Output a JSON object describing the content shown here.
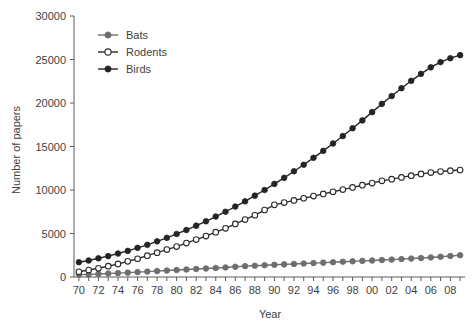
{
  "chart_data": {
    "type": "line",
    "title": "",
    "xlabel": "Year",
    "ylabel": "Number of papers",
    "xlim": [
      1969.5,
      2009.5
    ],
    "ylim": [
      0,
      30000
    ],
    "grid": false,
    "legend_position": "top-left-inside",
    "y_ticks": [
      0,
      5000,
      10000,
      15000,
      20000,
      25000,
      30000
    ],
    "y_tick_labels": [
      "0",
      "5000",
      "10000",
      "15000",
      "20000",
      "25000",
      "30000"
    ],
    "x_ticks": [
      1970,
      1971,
      1972,
      1973,
      1974,
      1975,
      1976,
      1977,
      1978,
      1979,
      1980,
      1981,
      1982,
      1983,
      1984,
      1985,
      1986,
      1987,
      1988,
      1989,
      1990,
      1991,
      1992,
      1993,
      1994,
      1995,
      1996,
      1997,
      1998,
      1999,
      2000,
      2001,
      2002,
      2003,
      2004,
      2005,
      2006,
      2007,
      2008,
      2009
    ],
    "x_tick_labels": [
      "70",
      "",
      "72",
      "",
      "74",
      "",
      "76",
      "",
      "78",
      "",
      "80",
      "",
      "82",
      "",
      "84",
      "",
      "86",
      "",
      "88",
      "",
      "90",
      "",
      "92",
      "",
      "94",
      "",
      "96",
      "",
      "98",
      "",
      "00",
      "",
      "02",
      "",
      "04",
      "",
      "06",
      "",
      "08",
      ""
    ],
    "x": [
      1970,
      1971,
      1972,
      1973,
      1974,
      1975,
      1976,
      1977,
      1978,
      1979,
      1980,
      1981,
      1982,
      1983,
      1984,
      1985,
      1986,
      1987,
      1988,
      1989,
      1990,
      1991,
      1992,
      1993,
      1994,
      1995,
      1996,
      1997,
      1998,
      1999,
      2000,
      2001,
      2002,
      2003,
      2004,
      2005,
      2006,
      2007,
      2008,
      2009
    ],
    "series": [
      {
        "name": "Bats",
        "marker": "filled-circle",
        "color": "#6e6e6e",
        "line_color": "#6e6e6e",
        "values": [
          250,
          300,
          350,
          400,
          450,
          500,
          560,
          620,
          680,
          740,
          800,
          860,
          920,
          980,
          1040,
          1100,
          1180,
          1250,
          1300,
          1350,
          1400,
          1450,
          1500,
          1550,
          1600,
          1650,
          1700,
          1750,
          1800,
          1850,
          1900,
          1950,
          2000,
          2060,
          2120,
          2180,
          2250,
          2330,
          2420,
          2500
        ]
      },
      {
        "name": "Rodents",
        "marker": "open-circle",
        "color": "#ffffff",
        "line_color": "#2b2b2b",
        "values": [
          600,
          800,
          1000,
          1250,
          1500,
          1800,
          2100,
          2450,
          2800,
          3150,
          3500,
          3900,
          4300,
          4700,
          5150,
          5600,
          6100,
          6600,
          7100,
          7700,
          8300,
          8550,
          8800,
          9050,
          9300,
          9550,
          9800,
          10050,
          10300,
          10550,
          10800,
          11050,
          11250,
          11450,
          11650,
          11850,
          12000,
          12120,
          12220,
          12300
        ]
      },
      {
        "name": "Birds",
        "marker": "filled-circle",
        "color": "#242424",
        "line_color": "#242424",
        "values": [
          1700,
          1900,
          2150,
          2400,
          2700,
          3000,
          3350,
          3700,
          4100,
          4500,
          4950,
          5400,
          5900,
          6400,
          6950,
          7500,
          8100,
          8700,
          9350,
          10000,
          10700,
          11400,
          12150,
          12900,
          13700,
          14500,
          15350,
          16200,
          17100,
          18000,
          18950,
          19900,
          20800,
          21700,
          22550,
          23350,
          24100,
          24700,
          25150,
          25500
        ]
      }
    ],
    "legend": [
      {
        "label": "Bats",
        "marker": "filled-circle",
        "color": "#6e6e6e"
      },
      {
        "label": "Rodents",
        "marker": "open-circle",
        "color": "#ffffff"
      },
      {
        "label": "Birds",
        "marker": "filled-circle",
        "color": "#242424"
      }
    ]
  }
}
